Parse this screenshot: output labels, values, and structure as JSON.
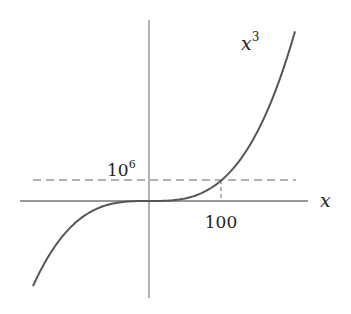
{
  "diagram": {
    "function_label": "x",
    "function_exponent": "3",
    "x_axis_label": "x",
    "y_marker_label_base": "10",
    "y_marker_label_exponent": "6",
    "x_marker_label": "100",
    "colors": {
      "curve": "#555555",
      "axes": "#777777",
      "dashed": "#666666",
      "text": "#222222"
    }
  },
  "chart_data": {
    "type": "line",
    "title": "",
    "series": [
      {
        "name": "x^3",
        "function": "y = x^3"
      }
    ],
    "annotations": [
      {
        "type": "hline",
        "y": 1000000,
        "label": "10^6",
        "style": "dashed"
      },
      {
        "type": "vline_segment",
        "x": 100,
        "label": "100",
        "style": "dashed"
      }
    ],
    "xlabel": "x",
    "ylabel": "",
    "grid": false
  }
}
